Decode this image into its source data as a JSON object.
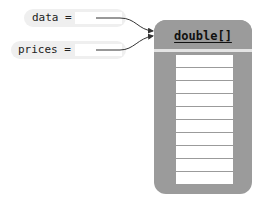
{
  "variables": [
    {
      "name": "data",
      "label": "data =",
      "value": ""
    },
    {
      "name": "prices",
      "label": "prices =",
      "value": ""
    }
  ],
  "object": {
    "type_label": "double[]",
    "cell_count": 10,
    "cells": [
      "",
      "",
      "",
      "",
      "",
      "",
      "",
      "",
      "",
      ""
    ]
  },
  "colors": {
    "pill": "#efefef",
    "object_fill": "#9b9b9b",
    "cell": "#ffffff",
    "arrow": "#333333"
  }
}
